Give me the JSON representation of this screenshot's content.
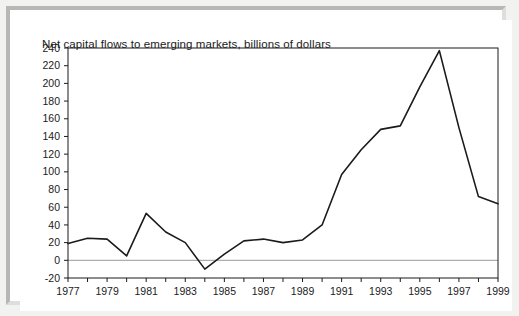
{
  "chart_data": {
    "type": "line",
    "title": "Net capital flows to emerging markets, billions of dollars",
    "xlabel": "",
    "ylabel": "",
    "ylim": [
      -20,
      240
    ],
    "xlim": [
      1977,
      1999
    ],
    "ytick_step": 20,
    "yticks": [
      240,
      220,
      200,
      180,
      160,
      140,
      120,
      100,
      80,
      60,
      40,
      20,
      0,
      -20
    ],
    "ytick_labels": [
      "240",
      "220",
      "200",
      "180",
      "160",
      "140",
      "120",
      "100",
      "80",
      "60",
      "40",
      "20",
      "0",
      "-20"
    ],
    "xticks": [
      1977,
      1978,
      1979,
      1980,
      1981,
      1982,
      1983,
      1984,
      1985,
      1986,
      1987,
      1988,
      1989,
      1990,
      1991,
      1992,
      1993,
      1994,
      1995,
      1996,
      1997,
      1998,
      1999
    ],
    "xtick_labels_shown": [
      "1977",
      "1979",
      "1981",
      "1983",
      "1985",
      "1987",
      "1989",
      "1991",
      "1993",
      "1995",
      "1997",
      "1999"
    ],
    "xtick_label_step": 2,
    "grid": false,
    "zero_line": true,
    "legend": null,
    "line_color": "#1b1b1b",
    "line_width": 1.6,
    "axis_color": "#1b1b1b",
    "zero_line_color": "#9a9a9a",
    "background_color": "#ffffff",
    "x": [
      1977,
      1978,
      1979,
      1980,
      1981,
      1982,
      1983,
      1984,
      1985,
      1986,
      1987,
      1988,
      1989,
      1990,
      1991,
      1992,
      1993,
      1994,
      1995,
      1996,
      1997,
      1998,
      1999
    ],
    "values": [
      19,
      25,
      24,
      5,
      53,
      32,
      20,
      -10,
      7,
      22,
      24,
      20,
      23,
      40,
      97,
      125,
      148,
      152,
      196,
      237,
      150,
      72,
      64
    ],
    "series": [
      {
        "name": "Net capital flows to emerging markets",
        "values": [
          19,
          25,
          24,
          5,
          53,
          32,
          20,
          -10,
          7,
          22,
          24,
          20,
          23,
          40,
          97,
          125,
          148,
          152,
          196,
          237,
          150,
          72,
          64
        ]
      }
    ],
    "annotations": []
  },
  "figure": {
    "frame_color": "#b7b7b5",
    "panel_color": "#ffffff",
    "page_color": "#f2f2f0"
  }
}
